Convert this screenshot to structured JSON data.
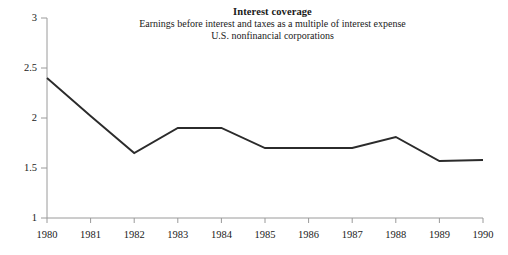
{
  "chart_data": {
    "type": "line",
    "title": "Interest coverage",
    "subtitle_1": "Earnings before interest and taxes as a multiple of interest expense",
    "subtitle_2": "U.S. nonfinancial corporations",
    "xlabel": "",
    "ylabel": "",
    "categories": [
      "1980",
      "1981",
      "1982",
      "1983",
      "1984",
      "1985",
      "1986",
      "1987",
      "1988",
      "1989",
      "1990"
    ],
    "x": [
      1980,
      1981,
      1982,
      1983,
      1984,
      1985,
      1986,
      1987,
      1988,
      1989,
      1990
    ],
    "values": [
      2.4,
      2.02,
      1.65,
      1.9,
      1.9,
      1.7,
      1.7,
      1.7,
      1.81,
      1.57,
      1.58
    ],
    "series": [
      {
        "name": "Interest coverage",
        "values": [
          2.4,
          2.02,
          1.65,
          1.9,
          1.9,
          1.7,
          1.7,
          1.7,
          1.81,
          1.57,
          1.58
        ]
      }
    ],
    "ylim": [
      1,
      3
    ],
    "xlim": [
      1980,
      1990
    ],
    "yticks": [
      1,
      1.5,
      2,
      2.5,
      3
    ],
    "ytick_labels": [
      "1",
      "1.5",
      "2",
      "2.5",
      "3"
    ],
    "xticks": [
      1980,
      1981,
      1982,
      1983,
      1984,
      1985,
      1986,
      1987,
      1988,
      1989,
      1990
    ],
    "xtick_labels": [
      "1980",
      "1981",
      "1982",
      "1983",
      "1984",
      "1985",
      "1986",
      "1987",
      "1988",
      "1989",
      "1990"
    ],
    "grid": false,
    "legend": false,
    "legend_position": "none",
    "line_color": "#2b2b2b",
    "axis_color": "#9a9a9a",
    "background_color": "#ffffff"
  }
}
